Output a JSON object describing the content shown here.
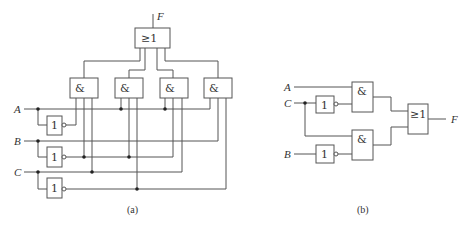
{
  "diagram_a": {
    "caption": "(a)",
    "output_label": "F",
    "inputs": [
      "A",
      "B",
      "C"
    ],
    "or_gate": {
      "symbol": "≥1"
    },
    "and_gates": [
      {
        "symbol": "&"
      },
      {
        "symbol": "&"
      },
      {
        "symbol": "&"
      },
      {
        "symbol": "&"
      }
    ],
    "not_gates": [
      {
        "symbol": "1"
      },
      {
        "symbol": "1"
      },
      {
        "symbol": "1"
      }
    ]
  },
  "diagram_b": {
    "caption": "(b)",
    "output_label": "F",
    "inputs": [
      "A",
      "C",
      "B"
    ],
    "or_gate": {
      "symbol": "≥1"
    },
    "and_gates": [
      {
        "symbol": "&"
      },
      {
        "symbol": "&"
      }
    ],
    "not_gates": [
      {
        "symbol": "1"
      },
      {
        "symbol": "1"
      }
    ]
  }
}
